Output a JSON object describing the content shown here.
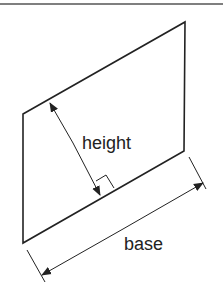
{
  "diagram": {
    "labels": {
      "height": "height",
      "base": "base"
    },
    "colors": {
      "stroke": "#222222",
      "background": "#ffffff",
      "border": "#555555"
    },
    "shape": {
      "type": "parallelogram",
      "vertices": [
        [
          23,
          114
        ],
        [
          185,
          22
        ],
        [
          184,
          151
        ],
        [
          23,
          243
        ]
      ]
    }
  }
}
